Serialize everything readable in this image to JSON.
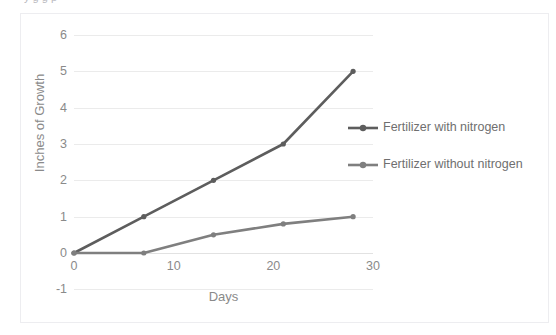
{
  "title_sliver": "y       g    g  p",
  "chart_data": {
    "type": "line",
    "title": "",
    "xlabel": "Days",
    "ylabel": "Inches of Growth",
    "xlim": [
      0,
      30
    ],
    "ylim": [
      -1,
      6
    ],
    "xticks": [
      0,
      10,
      20,
      30
    ],
    "yticks": [
      6,
      5,
      4,
      3,
      2,
      1,
      0,
      -1
    ],
    "grid": true,
    "legend_position": "right",
    "x": [
      0,
      7,
      14,
      21,
      28
    ],
    "series": [
      {
        "name": "Fertilizer with nitrogen",
        "color": "#5d5d5d",
        "values": [
          0,
          1,
          2,
          3,
          5
        ]
      },
      {
        "name": "Fertilizer without nitrogen",
        "color": "#7f7f7f",
        "values": [
          0,
          0,
          0.5,
          0.8,
          1
        ]
      }
    ]
  },
  "legend": {
    "entries": [
      {
        "label": "Fertilizer with nitrogen",
        "color": "#5d5d5d"
      },
      {
        "label": "Fertilizer without nitrogen",
        "color": "#7f7f7f"
      }
    ]
  }
}
